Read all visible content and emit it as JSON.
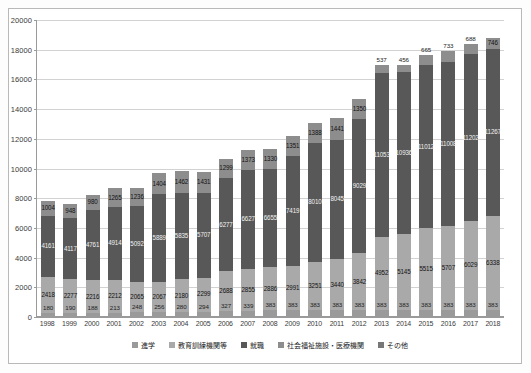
{
  "chart_data": {
    "type": "bar",
    "subtype": "stacked",
    "title": "",
    "xlabel": "",
    "ylabel": "",
    "ylim": [
      0,
      20000
    ],
    "ytick_step": 2000,
    "yticks": [
      "0",
      "2000",
      "4000",
      "6000",
      "8000",
      "10000",
      "12000",
      "14000",
      "16000",
      "18000",
      "20000"
    ],
    "grid": true,
    "legend_position": "bottom",
    "categories": [
      "1998",
      "1999",
      "2000",
      "2001",
      "2002",
      "2003",
      "2004",
      "2005",
      "2006",
      "2007",
      "2008",
      "2009",
      "2010",
      "2011",
      "2012",
      "2013",
      "2014",
      "2015",
      "2016",
      "2017",
      "2018"
    ],
    "series": [
      {
        "name": "進学",
        "color": "#9a9a9a",
        "values": [
          180,
          190,
          188,
          213,
          248,
          256,
          280,
          294,
          327,
          339,
          383,
          383,
          383,
          383,
          383,
          383,
          383,
          383,
          383,
          383,
          383
        ]
      },
      {
        "name": "教育訓練機関等",
        "color": "#a9a9a9",
        "values": [
          2418,
          2277,
          2216,
          2212,
          2065,
          2067,
          2180,
          2299,
          2688,
          2855,
          2886,
          2991,
          3251,
          3440,
          3842,
          4952,
          5145,
          5515,
          5707,
          6029,
          6338
        ]
      },
      {
        "name": "就職",
        "color": "#585858",
        "values": [
          4161,
          4117,
          4761,
          4914,
          5092,
          5889,
          5835,
          5707,
          6277,
          6627,
          6655,
          7419,
          8010,
          8045,
          9029,
          11053,
          10936,
          11012,
          11008,
          11202,
          11267
        ]
      },
      {
        "name": "社会福祉施設・医療機関",
        "color": "#8d8d8d",
        "values": [
          1004,
          948,
          980,
          1265,
          1236,
          1404,
          1462,
          1431,
          1299,
          1373,
          1330,
          1351,
          1388,
          1441,
          1350,
          1350,
          1350,
          1350,
          1350,
          1350,
          1350
        ]
      },
      {
        "name": "その他",
        "color": "#8d8d8d",
        "values": [
          0,
          0,
          0,
          0,
          0,
          0,
          0,
          0,
          0,
          0,
          0,
          0,
          0,
          0,
          0,
          537,
          456,
          665,
          733,
          688,
          746
        ]
      }
    ],
    "bar_labels": {
      "bottom": [
        "180",
        "190",
        "188",
        "213",
        "248",
        "256",
        "280",
        "294",
        "327",
        "339",
        "383",
        "383",
        "383",
        "383",
        "383",
        "383",
        "383",
        "383",
        "383",
        "383",
        "383"
      ],
      "second": [
        "2418",
        "2277",
        "2216",
        "2212",
        "2065",
        "2067",
        "2180",
        "2299",
        "2688",
        "2855",
        "2886",
        "2991",
        "3251",
        "3440",
        "3842",
        "4952",
        "5145",
        "5515",
        "5707",
        "6029",
        "6338"
      ],
      "third": [
        "4161",
        "4117",
        "4761",
        "4914",
        "5092",
        "5889",
        "5835",
        "5707",
        "6277",
        "6627",
        "6655",
        "7419",
        "8010",
        "8045",
        "9029",
        "11053",
        "10936",
        "11012",
        "11008",
        "11202",
        "11267"
      ],
      "top": [
        "1004",
        "948",
        "980",
        "1265",
        "1236",
        "1404",
        "1462",
        "1431",
        "1299",
        "1373",
        "1330",
        "1351",
        "1388",
        "1441",
        "1350",
        "537",
        "456",
        "665",
        "733",
        "688",
        "746"
      ]
    }
  },
  "legend": {
    "items": [
      {
        "label": "進学",
        "color": "#9a9a9a"
      },
      {
        "label": "教育訓練機関等",
        "color": "#a9a9a9"
      },
      {
        "label": "就職",
        "color": "#585858"
      },
      {
        "label": "社会福祉施設・医療機関",
        "color": "#8d8d8d"
      },
      {
        "label": "その他",
        "color": "#777777"
      }
    ]
  }
}
